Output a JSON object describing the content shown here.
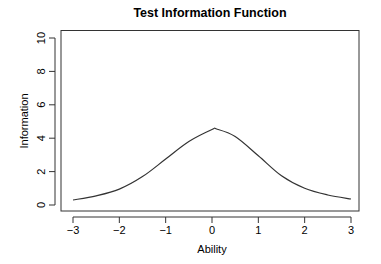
{
  "chart_data": {
    "type": "line",
    "title": "Test Information Function",
    "xlabel": "Ability",
    "ylabel": "Information",
    "xlim": [
      -3,
      3
    ],
    "ylim": [
      0,
      10
    ],
    "x_ticks": [
      -3,
      -2,
      -1,
      0,
      1,
      2,
      3
    ],
    "x_tick_labels": [
      "−3",
      "−2",
      "−1",
      "0",
      "1",
      "2",
      "3"
    ],
    "y_ticks": [
      0,
      2,
      4,
      6,
      8,
      10
    ],
    "y_tick_labels": [
      "0",
      "2",
      "4",
      "6",
      "8",
      "10"
    ],
    "grid": false,
    "legend": null,
    "series": [
      {
        "name": "Test Information",
        "color": "#333333",
        "x": [
          -3,
          -2.5,
          -2,
          -1.5,
          -1,
          -0.5,
          0,
          0.1,
          0.5,
          1,
          1.5,
          2,
          2.5,
          3
        ],
        "y": [
          0.3,
          0.55,
          0.95,
          1.7,
          2.75,
          3.8,
          4.52,
          4.55,
          4.1,
          2.95,
          1.75,
          1.0,
          0.6,
          0.36
        ]
      }
    ]
  }
}
